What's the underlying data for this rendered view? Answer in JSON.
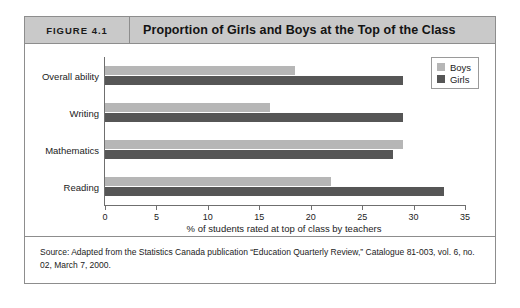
{
  "figure": {
    "number_label": "FIGURE 4.1",
    "title": "Proportion of Girls and Boys at the Top of the Class",
    "source_note": "Source: Adapted from the Statistics Canada publication “Education Quarterly Review,” Catalogue 81-003, vol. 6, no. 02, March 7, 2000."
  },
  "colors": {
    "boys": "#b6b6b6",
    "girls": "#565656",
    "header_band": "#c9c9c9",
    "frame": "#8d8d8d",
    "axis": "#6f6f6f"
  },
  "chart_data": {
    "type": "bar",
    "orientation": "horizontal",
    "title": "Proportion of Girls and Boys at the Top of the Class",
    "categories": [
      "Overall ability",
      "Writing",
      "Mathematics",
      "Reading"
    ],
    "series": [
      {
        "name": "Boys",
        "values": [
          18.5,
          16.0,
          29.0,
          22.0
        ]
      },
      {
        "name": "Girls",
        "values": [
          29.0,
          29.0,
          28.0,
          33.0
        ]
      }
    ],
    "xlabel": "% of students rated at top of class by teachers",
    "ylabel": "",
    "xlim": [
      0,
      35
    ],
    "xticks": [
      0,
      5,
      10,
      15,
      20,
      25,
      30,
      35
    ],
    "xticklabels": [
      "0",
      "5",
      "10",
      "15",
      "20",
      "25",
      "30",
      "35"
    ],
    "grid": false,
    "legend_position": "top-right",
    "legend_entries": [
      "Boys",
      "Girls"
    ]
  }
}
